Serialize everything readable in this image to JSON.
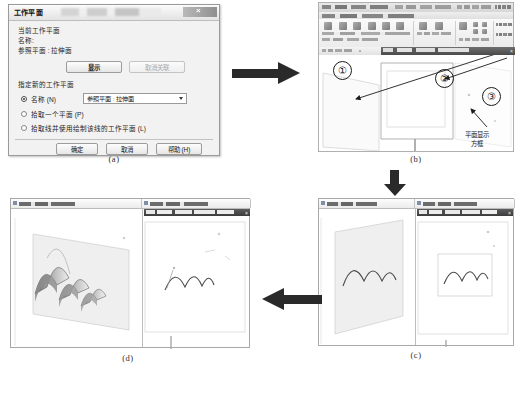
{
  "figure": {
    "captions": [
      {
        "id": "a",
        "label": "(a)"
      },
      {
        "id": "b",
        "label": "(b)"
      },
      {
        "id": "c",
        "label": "(c)"
      },
      {
        "id": "d",
        "label": "(d)"
      }
    ],
    "flow_arrows": [
      {
        "name": "arrow-a-to-b",
        "direction": "right"
      },
      {
        "name": "arrow-b-to-c",
        "direction": "down"
      },
      {
        "name": "arrow-c-to-d",
        "direction": "left"
      }
    ]
  },
  "dialog": {
    "title": "工作平面",
    "current_group_label": "当前工作平面",
    "name_label": "名称:",
    "current_plane_value": "参照平面 : 拉伸面",
    "show_button": "显示",
    "dissociate_button": "取消关联",
    "new_group_label": "指定新的工作平面",
    "radio_name": "名称 (N)",
    "radio_pick_plane": "拾取一个平面 (P)",
    "radio_pick_line": "拾取线并使用绘制该线的工作平面 (L)",
    "combo_value": "参照平面 : 拉伸面",
    "ok_button": "确定",
    "cancel_button": "取消",
    "help_button": "帮助 (H)",
    "close_icon": "×"
  },
  "panel_b": {
    "markers": [
      "①",
      "②",
      "③"
    ],
    "annotation": "平面显示\n方框",
    "annotation_line1": "平面显示",
    "annotation_line2": "方框",
    "arrow_pointers": [
      {
        "name": "pointer-to-plane-edge",
        "target": "①"
      },
      {
        "name": "pointer-to-sketch-window",
        "target": "②"
      },
      {
        "name": "pointer-to-plane-box",
        "target": "③"
      }
    ]
  },
  "panel_c": {
    "view_tabs": [
      "三维视图",
      "楼层平面"
    ],
    "sketch_title": "工作平面编辑器",
    "content_note": "三段圆弧"
  },
  "panel_d": {
    "view_tabs": [
      "三维视图",
      "楼层平面"
    ],
    "sketch_title": "工作平面编辑器",
    "content_note": "拉伸形成的波浪面"
  },
  "colors": {
    "arrow": "#2a2a2a",
    "dialog_bg": "#f2f2f2",
    "border": "#9a9a9a",
    "plane_fill": "#ebebeb",
    "surface_dark": "#6e6e6e",
    "surface_light": "#d9d9d9"
  }
}
